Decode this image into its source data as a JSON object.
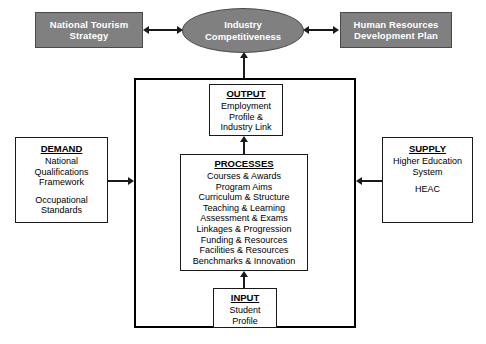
{
  "diagram": {
    "type": "flow-diagram",
    "top_row": {
      "left_box": {
        "name": "national-tourism-strategy",
        "lines": [
          "National Tourism",
          "Strategy"
        ],
        "fill": "#808080",
        "text_color": "#ffffff"
      },
      "center_ellipse": {
        "name": "industry-competitiveness",
        "lines": [
          "Industry",
          "Competitiveness"
        ],
        "fill": "#808080",
        "text_color": "#ffffff"
      },
      "right_box": {
        "name": "human-resources-development-plan",
        "lines": [
          "Human Resources",
          "Development Plan"
        ],
        "fill": "#808080",
        "text_color": "#ffffff"
      }
    },
    "left_box": {
      "title": "DEMAND",
      "group_one": [
        "National",
        "Qualifications",
        "Framework"
      ],
      "group_two": [
        "Occupational",
        "Standards"
      ]
    },
    "right_box": {
      "title": "SUPPLY",
      "group_one": [
        "Higher Education",
        "System"
      ],
      "group_two": [
        "HEAC"
      ]
    },
    "output_box": {
      "title": "OUTPUT",
      "lines": [
        "Employment",
        "Profile &",
        "Industry Link"
      ]
    },
    "processes_box": {
      "title": "PROCESSES",
      "lines": [
        "Courses & Awards",
        "Program Aims",
        "Curriculum & Structure",
        "Teaching & Learning",
        "Assessment & Exams",
        "Linkages & Progression",
        "Funding & Resources",
        "Facilities & Resources",
        "Benchmarks & Innovation"
      ]
    },
    "input_box": {
      "title": "INPUT",
      "lines": [
        "Student",
        "Profile"
      ]
    },
    "connectors": [
      {
        "name": "strategy-to-ellipse",
        "style": "double-headed-horizontal"
      },
      {
        "name": "ellipse-to-hr-plan",
        "style": "double-headed-horizontal"
      },
      {
        "name": "system-to-ellipse",
        "style": "arrow-up"
      },
      {
        "name": "demand-to-system",
        "style": "arrow-right"
      },
      {
        "name": "supply-to-system",
        "style": "arrow-left"
      },
      {
        "name": "processes-to-output",
        "style": "arrow-up"
      },
      {
        "name": "input-to-processes",
        "style": "arrow-up"
      }
    ]
  }
}
